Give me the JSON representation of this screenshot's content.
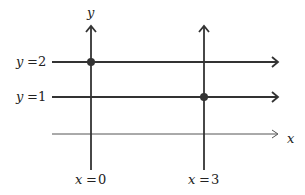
{
  "diagram": {
    "axis_labels": {
      "y": "y",
      "x": "x"
    },
    "horizontal_lines": [
      {
        "label_var": "y",
        "label_eq": "=",
        "label_val": "2",
        "y_value": 2
      },
      {
        "label_var": "y",
        "label_eq": "=",
        "label_val": "1",
        "y_value": 1
      }
    ],
    "vertical_lines": [
      {
        "label_var": "x",
        "label_eq": "=",
        "label_val": "0",
        "x_value": 0
      },
      {
        "label_var": "x",
        "label_eq": "=",
        "label_val": "3",
        "x_value": 3
      }
    ],
    "points": [
      {
        "x": 0,
        "y": 2
      },
      {
        "x": 3,
        "y": 1
      }
    ],
    "colors": {
      "line": "#333333",
      "axis": "#555555",
      "point": "#333333"
    }
  }
}
